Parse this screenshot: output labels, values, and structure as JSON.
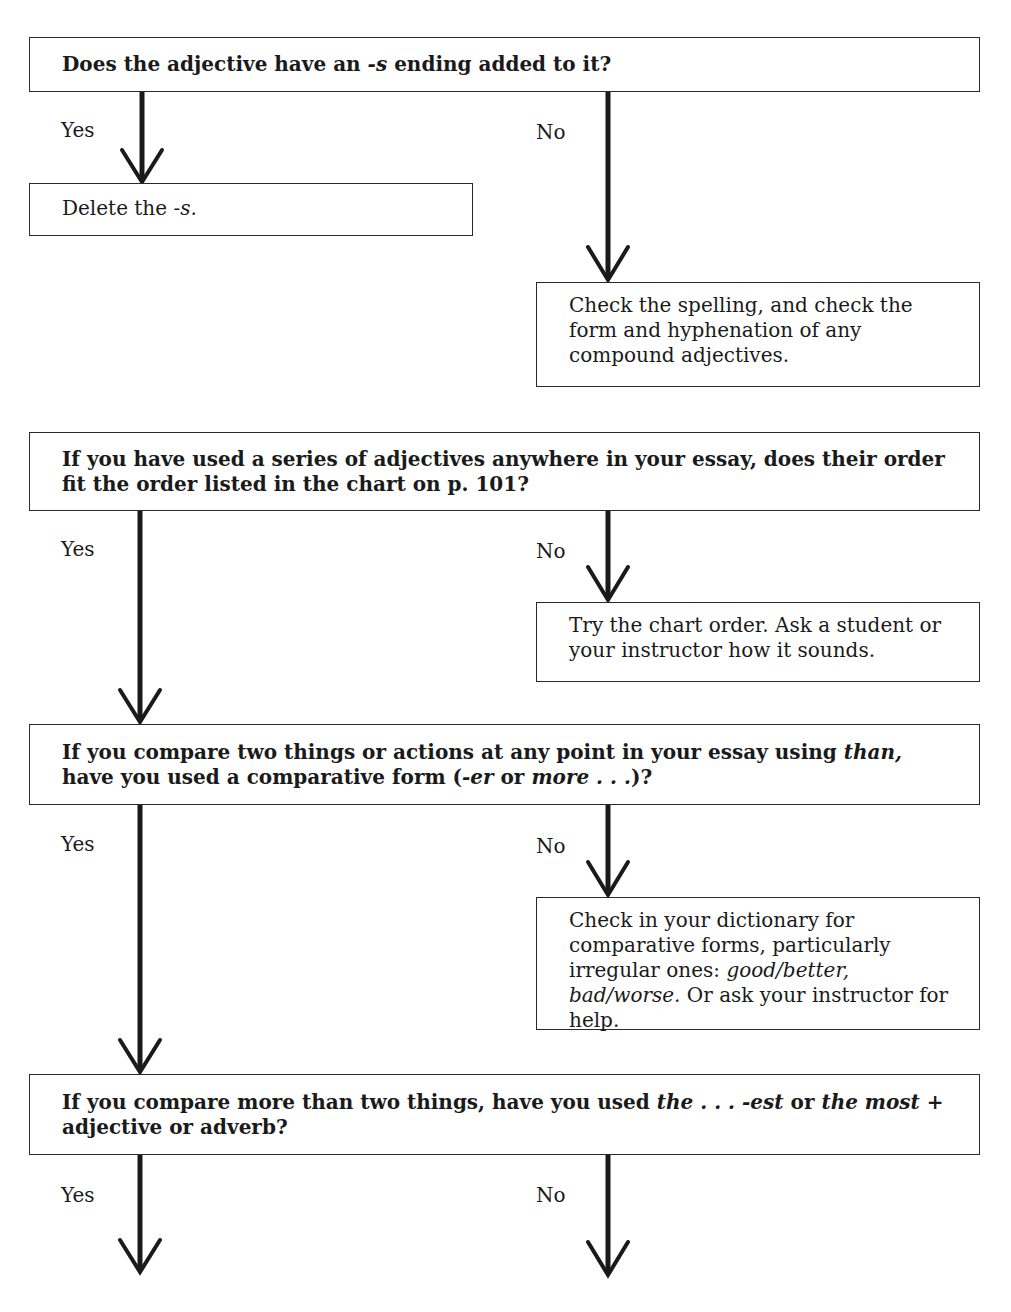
{
  "questions": [
    {
      "text": "Does the adjective have an -s ending added to it?",
      "yes_label": "Yes",
      "no_label": "No",
      "yes_action": "Delete the -s.",
      "no_action": "Check the spelling, and check the form and hyphenation of any compound adjectives."
    },
    {
      "text": "If you have used a series of adjectives anywhere in your essay, does their order fit the order listed in the chart on p. 101?",
      "yes_label": "Yes",
      "no_label": "No",
      "no_action": "Try the chart order. Ask a student or your instructor how it sounds."
    },
    {
      "text": "If you compare two things or actions at any point in your essay using than, have you used a comparative form (-er or more . . .)?",
      "yes_label": "Yes",
      "no_label": "No",
      "no_action": "Check in your dictionary for comparative forms, particularly irregular ones: good/better, bad/worse. Or ask your instructor for help."
    },
    {
      "text": "If you compare more than two things, have you used the . . . -est or the most + adjective or adverb?",
      "yes_label": "Yes",
      "no_label": "No"
    }
  ],
  "colors": {
    "line": "#1a1a1a",
    "background": "#ffffff"
  }
}
